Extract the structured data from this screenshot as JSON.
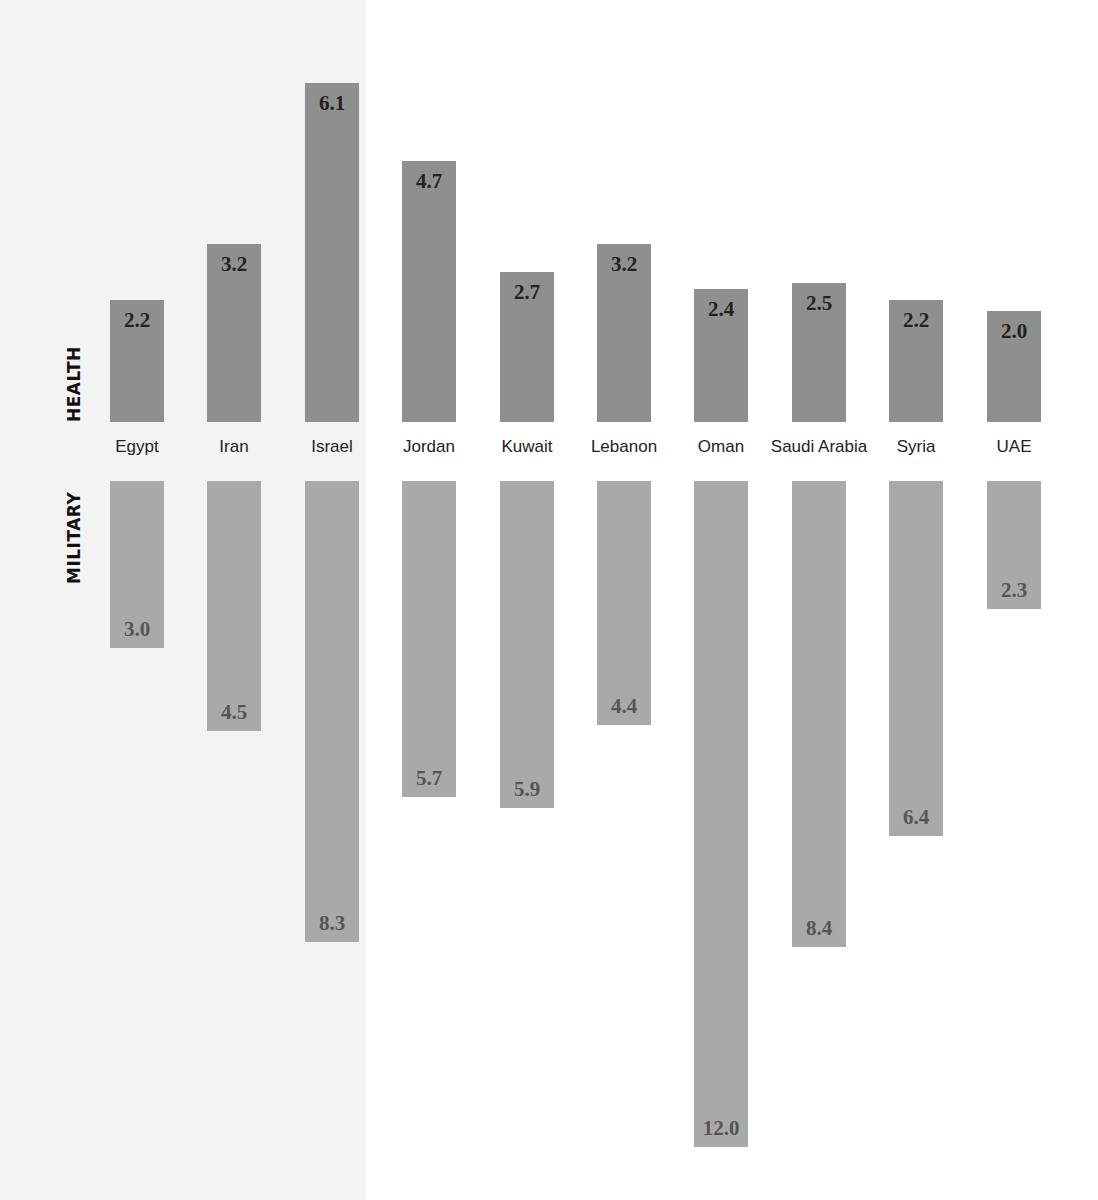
{
  "chart_data": {
    "type": "bar",
    "subtype": "diverging-vertical",
    "title": "",
    "categories": [
      "Egypt",
      "Iran",
      "Israel",
      "Jordan",
      "Kuwait",
      "Lebanon",
      "Oman",
      "Saudi Arabia",
      "Syria",
      "UAE"
    ],
    "series": [
      {
        "name": "HEALTH",
        "direction": "up",
        "color": "#8f8f8f",
        "label_color": "#222222",
        "values": [
          2.2,
          3.2,
          6.1,
          4.7,
          2.7,
          3.2,
          2.4,
          2.5,
          2.2,
          2.0
        ]
      },
      {
        "name": "MILITARY",
        "direction": "down",
        "color": "#a9a9a9",
        "label_color": "#555555",
        "values": [
          3.0,
          4.5,
          8.3,
          5.7,
          5.9,
          4.4,
          12.0,
          8.4,
          6.4,
          2.3
        ]
      }
    ],
    "xlabel": "",
    "ylabel": "",
    "grid": false,
    "legend": "none (series labelled vertically on left)",
    "data_labels": true
  },
  "labels": {
    "health": "HEALTH",
    "military": "MILITARY"
  },
  "colors": {
    "panel_bg": "#f3f3f3",
    "health_bar": "#8f8f8f",
    "military_bar": "#a9a9a9"
  }
}
